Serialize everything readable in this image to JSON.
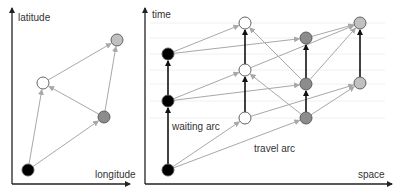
{
  "left_panel": {
    "x_axis_label": "longitude",
    "y_axis_label": "latitude",
    "nodes": [
      {
        "id": "A",
        "x": 28,
        "y": 170,
        "fill": "#000000"
      },
      {
        "id": "B",
        "x": 43,
        "y": 83,
        "fill": "#ffffff"
      },
      {
        "id": "C",
        "x": 104,
        "y": 117,
        "fill": "#8c8c8c"
      },
      {
        "id": "D",
        "x": 117,
        "y": 40,
        "fill": "#c0c0c0"
      }
    ],
    "edges": [
      {
        "from": "A",
        "to": "B"
      },
      {
        "from": "A",
        "to": "C"
      },
      {
        "from": "C",
        "to": "B"
      },
      {
        "from": "B",
        "to": "D"
      },
      {
        "from": "C",
        "to": "D"
      }
    ]
  },
  "right_panel": {
    "x_axis_label": "space",
    "y_axis_label": "time",
    "waiting_arc_label": "waiting arc",
    "travel_arc_label": "travel arc",
    "gridlines_y": [
      23,
      38,
      54,
      70,
      84,
      101,
      118
    ],
    "nodes": [
      {
        "id": "K1",
        "x": 168,
        "y": 170,
        "fill": "#000000"
      },
      {
        "id": "K2",
        "x": 168,
        "y": 101,
        "fill": "#000000"
      },
      {
        "id": "K3",
        "x": 168,
        "y": 54,
        "fill": "#000000"
      },
      {
        "id": "W1",
        "x": 245,
        "y": 118,
        "fill": "#ffffff"
      },
      {
        "id": "W2",
        "x": 245,
        "y": 70,
        "fill": "#ffffff"
      },
      {
        "id": "W3",
        "x": 245,
        "y": 23,
        "fill": "#ffffff"
      },
      {
        "id": "G1",
        "x": 306,
        "y": 118,
        "fill": "#8c8c8c"
      },
      {
        "id": "G2",
        "x": 306,
        "y": 84,
        "fill": "#8c8c8c"
      },
      {
        "id": "G3",
        "x": 306,
        "y": 38,
        "fill": "#8c8c8c"
      },
      {
        "id": "L1",
        "x": 360,
        "y": 83,
        "fill": "#c0c0c0"
      },
      {
        "id": "L2",
        "x": 360,
        "y": 23,
        "fill": "#c0c0c0"
      }
    ],
    "waiting_arcs": [
      {
        "from": "K1",
        "to": "K2"
      },
      {
        "from": "K2",
        "to": "K3"
      },
      {
        "from": "W1",
        "to": "W2"
      },
      {
        "from": "W2",
        "to": "W3"
      },
      {
        "from": "G1",
        "to": "G2"
      },
      {
        "from": "G2",
        "to": "G3"
      },
      {
        "from": "L1",
        "to": "L2"
      }
    ],
    "travel_arcs": [
      {
        "from": "K1",
        "to": "W1"
      },
      {
        "from": "K1",
        "to": "G1"
      },
      {
        "from": "K2",
        "to": "W2"
      },
      {
        "from": "K2",
        "to": "G2"
      },
      {
        "from": "K3",
        "to": "W3"
      },
      {
        "from": "K3",
        "to": "G3"
      },
      {
        "from": "G1",
        "to": "W2"
      },
      {
        "from": "G2",
        "to": "W3"
      },
      {
        "from": "W1",
        "to": "L1"
      },
      {
        "from": "W2",
        "to": "L2"
      },
      {
        "from": "G1",
        "to": "L1"
      },
      {
        "from": "G2",
        "to": "L2"
      },
      {
        "from": "G3",
        "to": "L2"
      }
    ]
  },
  "colors": {
    "axis": "#222222",
    "travel_arc": "#a8a8a8",
    "waiting_arc": "#111111",
    "gridline": "#f0f0f0",
    "node_stroke": "#555555"
  }
}
